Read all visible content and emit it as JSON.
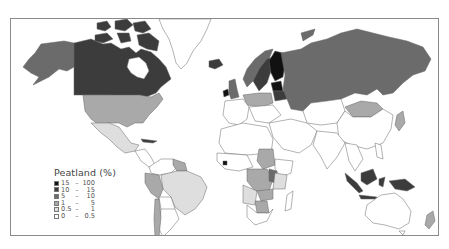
{
  "legend": {
    "title": "Peatland (%)",
    "classes": [
      {
        "lo": "15",
        "hi": "100",
        "color": "#111111"
      },
      {
        "lo": "10",
        "hi": "15",
        "color": "#3c3c3c"
      },
      {
        "lo": "5",
        "hi": "10",
        "color": "#6b6b6b"
      },
      {
        "lo": "1",
        "hi": "5",
        "color": "#a9a9a9"
      },
      {
        "lo": "0.5",
        "hi": "1",
        "color": "#dedede"
      },
      {
        "lo": "0",
        "hi": "0.5",
        "color": "#ffffff"
      }
    ],
    "dash": "–"
  },
  "map": {
    "title": "World peatland coverage by country",
    "colors": {
      "c15_100": "#111111",
      "c10_15": "#3c3c3c",
      "c5_10": "#6b6b6b",
      "c1_5": "#a9a9a9",
      "c05_1": "#dedede",
      "c0_05": "#ffffff",
      "border": "#666666",
      "frame": "#8a8a8a"
    },
    "regions": [
      {
        "name": "Canada",
        "class": "10-15"
      },
      {
        "name": "Alaska (USA)",
        "class": "5-10"
      },
      {
        "name": "USA",
        "class": "1-5"
      },
      {
        "name": "Mexico",
        "class": "0.5-1"
      },
      {
        "name": "Greenland",
        "class": "0-0.5"
      },
      {
        "name": "Iceland",
        "class": "10-15"
      },
      {
        "name": "Ireland",
        "class": "15-100"
      },
      {
        "name": "United Kingdom",
        "class": "5-10"
      },
      {
        "name": "Norway",
        "class": "5-10"
      },
      {
        "name": "Sweden",
        "class": "10-15"
      },
      {
        "name": "Finland",
        "class": "15-100"
      },
      {
        "name": "Estonia / Latvia",
        "class": "15-100"
      },
      {
        "name": "Belarus",
        "class": "10-15"
      },
      {
        "name": "Russia",
        "class": "5-10"
      },
      {
        "name": "Mongolia",
        "class": "1-5"
      },
      {
        "name": "Germany / Poland",
        "class": "1-5"
      },
      {
        "name": "Sudan",
        "class": "1-5"
      },
      {
        "name": "DR Congo",
        "class": "1-5"
      },
      {
        "name": "Uganda",
        "class": "5-10"
      },
      {
        "name": "Zambia",
        "class": "1-5"
      },
      {
        "name": "Botswana",
        "class": "1-5"
      },
      {
        "name": "Guinea",
        "class": "15-100"
      },
      {
        "name": "Indonesia",
        "class": "10-15"
      },
      {
        "name": "Papua New Guinea",
        "class": "10-15"
      },
      {
        "name": "Malaysia",
        "class": "10-15"
      },
      {
        "name": "Brazil",
        "class": "0.5-1"
      },
      {
        "name": "Peru",
        "class": "1-5"
      },
      {
        "name": "Guyana / Suriname",
        "class": "1-5"
      },
      {
        "name": "Chile",
        "class": "1-5"
      },
      {
        "name": "Cuba",
        "class": "10-15"
      },
      {
        "name": "Australia",
        "class": "0-0.5"
      },
      {
        "name": "New Zealand",
        "class": "1-5"
      },
      {
        "name": "Japan",
        "class": "1-5"
      }
    ]
  }
}
